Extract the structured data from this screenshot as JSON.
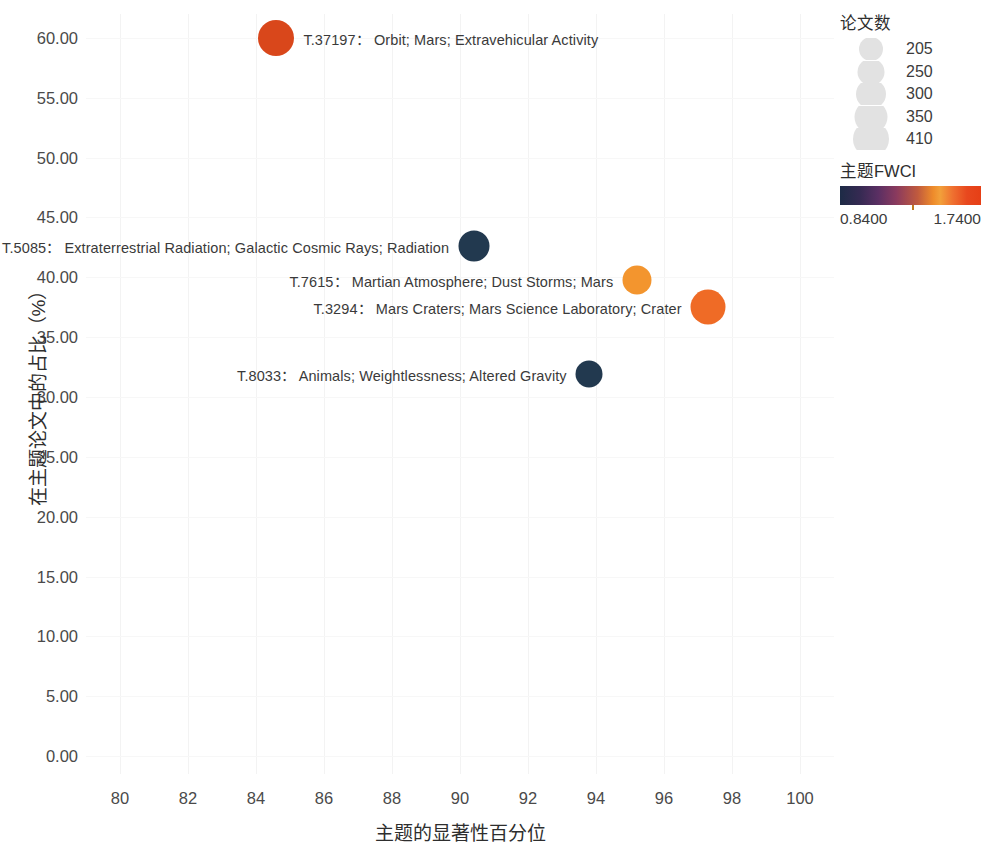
{
  "chart_data": {
    "type": "scatter",
    "title": "",
    "xlabel": "主题的显著性百分位",
    "ylabel": "在主题论文中的占比（%）",
    "xlim": [
      79,
      101
    ],
    "ylim": [
      -1.5,
      62
    ],
    "x_ticks": [
      "80",
      "82",
      "84",
      "86",
      "88",
      "90",
      "92",
      "94",
      "96",
      "98",
      "100"
    ],
    "x_tick_values": [
      80,
      82,
      84,
      86,
      88,
      90,
      92,
      94,
      96,
      98,
      100
    ],
    "y_ticks": [
      "0.00",
      "5.00",
      "10.00",
      "15.00",
      "20.00",
      "25.00",
      "30.00",
      "35.00",
      "40.00",
      "45.00",
      "50.00",
      "55.00",
      "60.00"
    ],
    "y_tick_values": [
      0,
      5,
      10,
      15,
      20,
      25,
      30,
      35,
      40,
      45,
      50,
      55,
      60
    ],
    "grid": true,
    "size_metric": "论文数",
    "color_metric": "主题FWCI",
    "points": [
      {
        "id": "T.37197",
        "label": "T.37197：  Orbit; Mars; Extravehicular Activity",
        "x": 84.6,
        "y": 60.0,
        "size": 410,
        "fwci": 1.52,
        "color": "#d9471b",
        "diameter_px": 36,
        "label_side": "right"
      },
      {
        "id": "T.5085",
        "label": "T.5085：  Extraterrestrial Radiation; Galactic Cosmic Rays; Radiation",
        "x": 90.4,
        "y": 42.6,
        "size": 300,
        "fwci": 0.86,
        "color": "#22394f",
        "diameter_px": 31,
        "label_side": "left"
      },
      {
        "id": "T.7615",
        "label": "T.7615：  Martian Atmosphere; Dust Storms; Mars",
        "x": 95.2,
        "y": 39.8,
        "size": 250,
        "fwci": 1.3,
        "color": "#f3952e",
        "diameter_px": 29,
        "label_side": "left"
      },
      {
        "id": "T.3294",
        "label": "T.3294：  Mars Craters; Mars Science Laboratory; Crater",
        "x": 97.3,
        "y": 37.5,
        "size": 350,
        "fwci": 1.46,
        "color": "#ef6b26",
        "diameter_px": 35,
        "label_side": "left"
      },
      {
        "id": "T.8033",
        "label": "T.8033：  Animals; Weightlessness; Altered Gravity",
        "x": 93.8,
        "y": 31.9,
        "size": 250,
        "fwci": 0.84,
        "color": "#22394f",
        "diameter_px": 27,
        "label_side": "left"
      }
    ]
  },
  "size_legend": {
    "title": "论文数",
    "items": [
      {
        "label": "205",
        "diameter_px": 24
      },
      {
        "label": "250",
        "diameter_px": 27
      },
      {
        "label": "300",
        "diameter_px": 30
      },
      {
        "label": "350",
        "diameter_px": 33
      },
      {
        "label": "410",
        "diameter_px": 36
      }
    ],
    "swatch_color": "#e2e2e2"
  },
  "color_legend": {
    "title": "主题FWCI",
    "min_label": "0.8400",
    "max_label": "1.7400",
    "min_value": 0.84,
    "max_value": 1.74,
    "marker_value": 1.3,
    "gradient_start": "#1d2b46",
    "gradient_end": "#e63f16"
  }
}
